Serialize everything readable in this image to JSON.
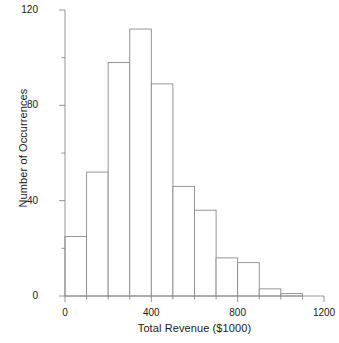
{
  "chart_data": {
    "type": "bar",
    "title": "",
    "subtitle": "",
    "xlabel": "Total Revenue ($1000)",
    "ylabel": "Number of Occurrences",
    "bin_width": 100,
    "bin_edges": [
      0,
      100,
      200,
      300,
      400,
      500,
      600,
      700,
      800,
      900,
      1000,
      1100
    ],
    "categories": [
      "0-100",
      "100-200",
      "200-300",
      "300-400",
      "400-500",
      "500-600",
      "600-700",
      "700-800",
      "800-900",
      "900-1000",
      "1000-1100"
    ],
    "values": [
      25,
      52,
      98,
      112,
      89,
      46,
      36,
      16,
      14,
      3,
      1
    ],
    "xlim": [
      0,
      1200
    ],
    "ylim": [
      0,
      120
    ],
    "xticks": [
      0,
      400,
      800,
      1200
    ],
    "xtick_labels": [
      "0",
      "400",
      "800",
      "1200"
    ],
    "xticks_minor": [
      100,
      200,
      300,
      500,
      600,
      700,
      900,
      1000,
      1100
    ],
    "yticks": [
      0,
      40,
      80,
      120
    ],
    "ytick_labels": [
      "0",
      "40",
      "80",
      "120"
    ],
    "yticks_minor": [
      20,
      60,
      100
    ],
    "grid": false,
    "legend": null,
    "bar_fill": "#ffffff",
    "bar_edge_color": "#8a8a8a",
    "axis_color": "#8a8a8a"
  }
}
